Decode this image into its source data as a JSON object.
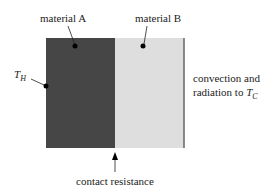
{
  "diagram": {
    "labels": {
      "material_a": "material A",
      "material_b": "material B",
      "t_hot_main": "T",
      "t_hot_sub": "H",
      "convection_line1": "convection and",
      "convection_line2": "radiation to ",
      "t_cold_main": "T",
      "t_cold_sub": "C",
      "contact_resistance": "contact resistance"
    },
    "colors": {
      "material_a": "#464646",
      "material_b": "#dedede",
      "edge": "#555555",
      "background": "#ffffff"
    }
  }
}
